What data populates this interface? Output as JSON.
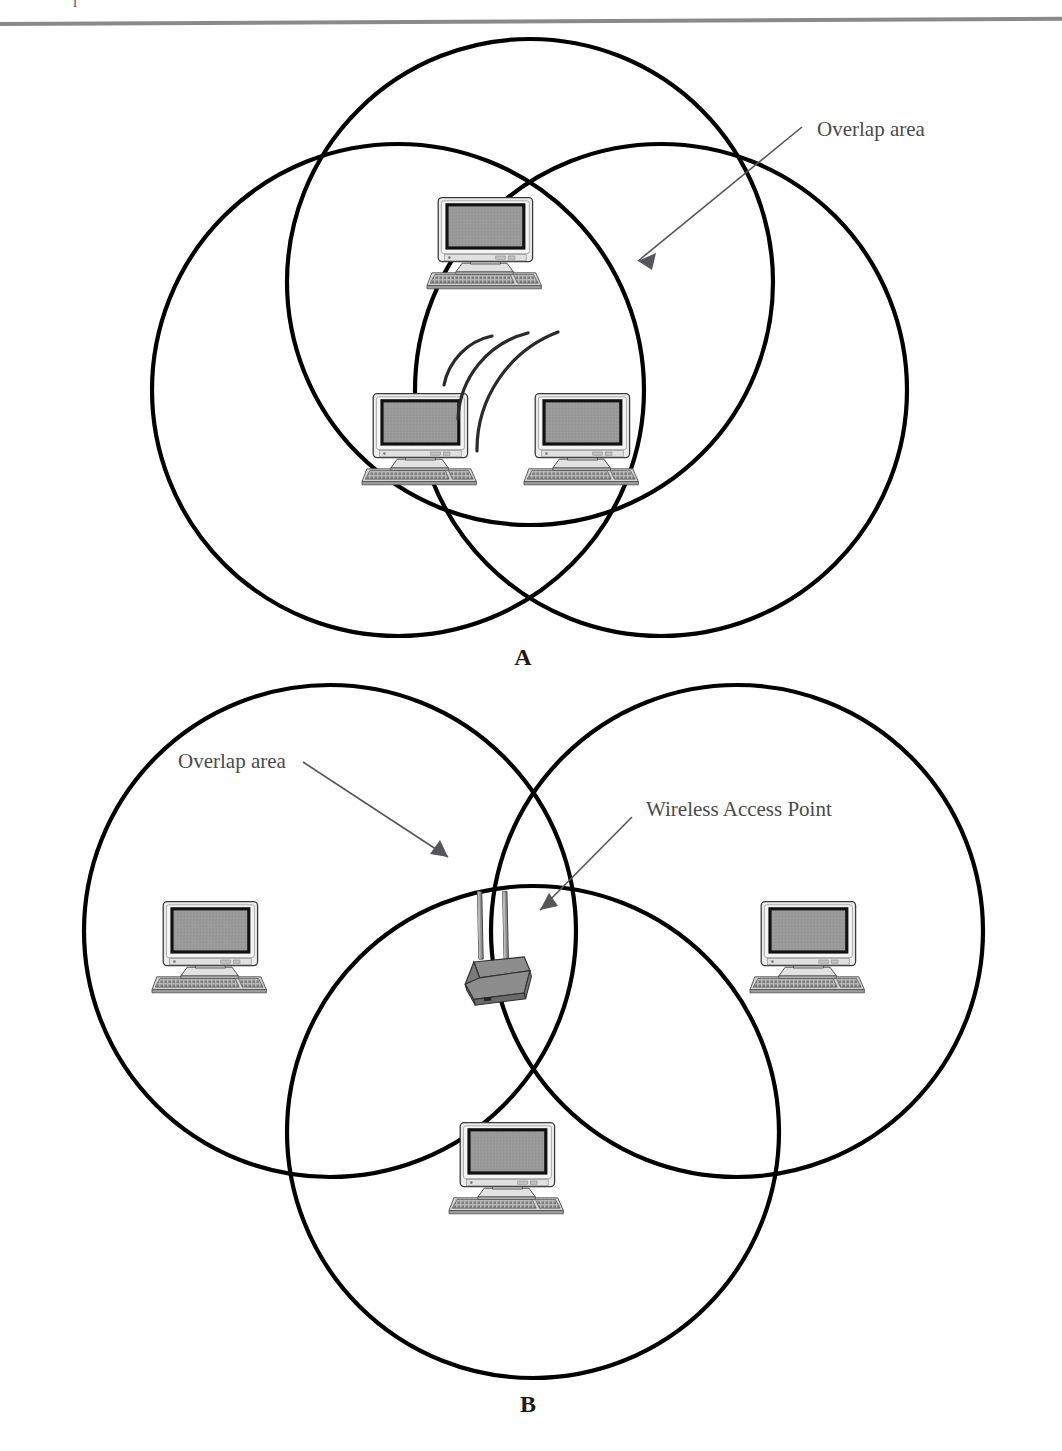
{
  "page": {
    "header_rule": "horizontal-rule",
    "cropped_text_fragment": "l"
  },
  "figure": {
    "panels": [
      {
        "id": "A",
        "label": "A",
        "description": "Three overlapping wireless coverage circles in an ad-hoc arrangement with three computers clustered in the central overlap region",
        "annotations": [
          {
            "name": "overlap-area",
            "text": "Overlap area"
          }
        ],
        "devices": [
          {
            "type": "computer",
            "name": "computer-top"
          },
          {
            "type": "computer",
            "name": "computer-bottom-left"
          },
          {
            "type": "computer",
            "name": "computer-bottom-right"
          },
          {
            "type": "signal-waves",
            "name": "wireless-signal-arcs"
          }
        ],
        "circles": [
          {
            "name": "coverage-circle-top",
            "cx": 530,
            "cy": 280,
            "r": 242
          },
          {
            "name": "coverage-circle-left",
            "cx": 397,
            "cy": 388,
            "r": 245
          },
          {
            "name": "coverage-circle-right",
            "cx": 660,
            "cy": 388,
            "r": 245
          }
        ]
      },
      {
        "id": "B",
        "label": "B",
        "description": "Three overlapping wireless coverage circles in an infrastructure arrangement with one wireless access point in the central overlap and one computer per circle",
        "annotations": [
          {
            "name": "overlap-area",
            "text": "Overlap area"
          },
          {
            "name": "wireless-access-point",
            "text": "Wireless Access Point"
          }
        ],
        "devices": [
          {
            "type": "computer",
            "name": "computer-left"
          },
          {
            "type": "computer",
            "name": "computer-right"
          },
          {
            "type": "computer",
            "name": "computer-bottom"
          },
          {
            "type": "access-point",
            "name": "wireless-access-point-device"
          }
        ],
        "circles": [
          {
            "name": "coverage-circle-top-left",
            "cx": 330,
            "cy": 930,
            "r": 245
          },
          {
            "name": "coverage-circle-top-right",
            "cx": 735,
            "cy": 930,
            "r": 245
          },
          {
            "name": "coverage-circle-bottom",
            "cx": 532,
            "cy": 1130,
            "r": 245
          }
        ]
      }
    ]
  },
  "colors": {
    "circle_stroke": "#000000",
    "annotation_text": "#4a4a4a",
    "leader_line": "#55555a",
    "screen_fill": "#999999",
    "chassis_light": "#e8e8e8",
    "chassis_mid": "#c9c9c9",
    "device_gray": "#8c8c8c",
    "rule_gray": "#8a8a8a"
  }
}
